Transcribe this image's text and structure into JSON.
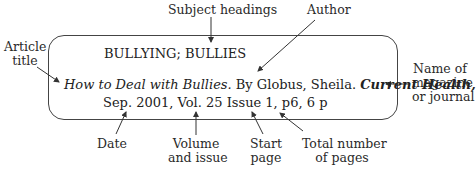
{
  "record": {
    "subject_headings": "BULLYING; BULLIES",
    "article_title": "How to Deal with Bullies.",
    "author_text": " By Globus, Sheila. ",
    "journal": "Current Health,",
    "line3": "Sep. 2001, Vol. 25 Issue 1, p6, 6 p"
  },
  "labels": {
    "subject_headings": "Subject headings",
    "author": "Author",
    "article_title_1": "Article",
    "article_title_2": "title",
    "journal_1": "Name of",
    "journal_2": "magazine",
    "journal_3": "or journal",
    "date": "Date",
    "volume_1": "Volume",
    "volume_2": "and issue",
    "start_1": "Start",
    "start_2": "page",
    "total_1": "Total number",
    "total_2": "of pages"
  }
}
